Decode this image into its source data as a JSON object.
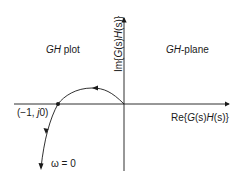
{
  "diagram": {
    "type": "nyquist-plot",
    "labels": {
      "region_left": {
        "italic": "GH",
        "text": " plot"
      },
      "region_right": {
        "italic": "GH",
        "text": "-plane"
      },
      "y_axis": {
        "pre": "Im{",
        "italic1": "G",
        "mid1": "(s)",
        "italic2": "H",
        "mid2": "(s)}"
      },
      "x_axis": {
        "pre": "Re{",
        "italic1": "G",
        "mid1": "(s)",
        "italic2": "H",
        "mid2": "(s)}"
      },
      "critical_point": {
        "pre": "(−1, ",
        "italic": "j",
        "post": "0)"
      },
      "omega_start": "ω = 0"
    },
    "colors": {
      "ink": "#1a1a1a",
      "background": "#ffffff"
    }
  }
}
